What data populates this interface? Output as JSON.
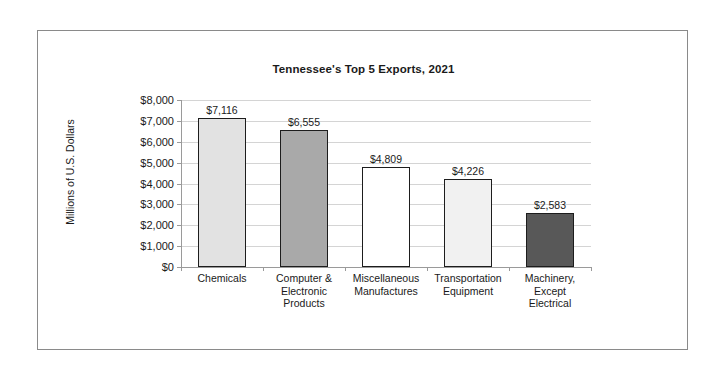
{
  "chart_data": {
    "type": "bar",
    "title": "Tennessee's Top 5 Exports, 2021",
    "xlabel": "",
    "ylabel": "Millions of U.S. Dollars",
    "categories": [
      "Chemicals",
      "Computer & Electronic Products",
      "Miscellaneous Manufactures",
      "Transportation Equipment",
      "Machinery, Except Electrical"
    ],
    "category_lines": [
      [
        "Chemicals"
      ],
      [
        "Computer &",
        "Electronic",
        "Products"
      ],
      [
        "Miscellaneous",
        "Manufactures"
      ],
      [
        "Transportation",
        "Equipment"
      ],
      [
        "Machinery,",
        "Except",
        "Electrical"
      ]
    ],
    "values": [
      7116,
      6555,
      4809,
      4226,
      2583
    ],
    "value_labels": [
      "$7,116",
      "$6,555",
      "$4,809",
      "$4,226",
      "$2,583"
    ],
    "bar_colors": [
      "#e2e2e2",
      "#a9a9a9",
      "#ffffff",
      "#f1f1f1",
      "#585858"
    ],
    "bar_border_color": "#1d1d1d",
    "ylim": [
      0,
      8000
    ],
    "ytick_values": [
      0,
      1000,
      2000,
      3000,
      4000,
      5000,
      6000,
      7000,
      8000
    ],
    "ytick_labels": [
      "$0",
      "$1,000",
      "$2,000",
      "$3,000",
      "$4,000",
      "$5,000",
      "$6,000",
      "$7,000",
      "$8,000"
    ],
    "grid": true,
    "grid_color": "#d4d4d4",
    "legend": false,
    "frame_color": "#8a8a8a",
    "background": "#ffffff"
  }
}
